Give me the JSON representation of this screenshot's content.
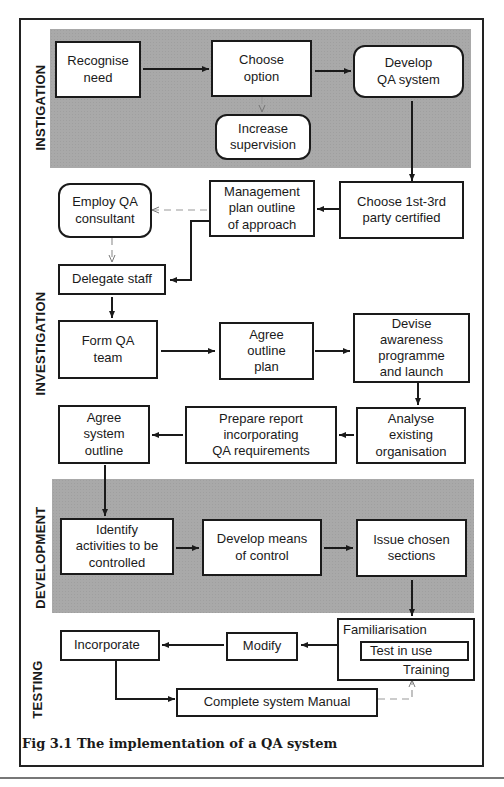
{
  "figure": {
    "caption": "Fig 3.1 The implementation of a QA system"
  },
  "phases": {
    "instigation": "INSTIGATION",
    "investigation": "INVESTIGATION",
    "development": "DEVELOPMENT",
    "testing": "TESTING"
  },
  "nodes": {
    "recognise_need": "Recognise\nneed",
    "choose_option": "Choose\noption",
    "develop_qa_system": "Develop\nQA system",
    "increase_supervision": "Increase\nsupervision",
    "employ_qa_consultant": "Employ QA\nconsultant",
    "management_plan": "Management\nplan outline\nof approach",
    "choose_party_certified": "Choose 1st-3rd\nparty certified",
    "delegate_staff": "Delegate staff",
    "form_qa_team": "Form QA\nteam",
    "agree_outline_plan": "Agree\noutline\nplan",
    "devise_awareness": "Devise\nawareness\nprogramme\nand launch",
    "agree_system_outline": "Agree\nsystem\noutline",
    "prepare_report": "Prepare report\nincorporating\nQA requirements",
    "analyse_existing": "Analyse\nexisting\norganisation",
    "identify_activities": "Identify\nactivities to be\ncontrolled",
    "develop_means_control": "Develop means\nof control",
    "issue_chosen_sections": "Issue chosen\nsections",
    "incorporate": "Incorporate",
    "modify": "Modify",
    "familiarisation": "Familiarisation",
    "test_in_use": "Test in use",
    "training": "Training",
    "complete_system_manual": "Complete system Manual"
  },
  "edges": [
    {
      "from": "recognise_need",
      "to": "choose_option",
      "style": "solid"
    },
    {
      "from": "choose_option",
      "to": "develop_qa_system",
      "style": "solid"
    },
    {
      "from": "choose_option",
      "to": "increase_supervision",
      "style": "dashed"
    },
    {
      "from": "develop_qa_system",
      "to": "choose_party_certified",
      "style": "solid"
    },
    {
      "from": "choose_party_certified",
      "to": "management_plan",
      "style": "solid"
    },
    {
      "from": "management_plan",
      "to": "employ_qa_consultant",
      "style": "dashed"
    },
    {
      "from": "management_plan",
      "to": "delegate_staff",
      "style": "solid"
    },
    {
      "from": "employ_qa_consultant",
      "to": "delegate_staff",
      "style": "dashed"
    },
    {
      "from": "delegate_staff",
      "to": "form_qa_team",
      "style": "solid"
    },
    {
      "from": "form_qa_team",
      "to": "agree_outline_plan",
      "style": "solid"
    },
    {
      "from": "agree_outline_plan",
      "to": "devise_awareness",
      "style": "solid"
    },
    {
      "from": "devise_awareness",
      "to": "analyse_existing",
      "style": "solid"
    },
    {
      "from": "analyse_existing",
      "to": "prepare_report",
      "style": "solid"
    },
    {
      "from": "prepare_report",
      "to": "agree_system_outline",
      "style": "solid"
    },
    {
      "from": "agree_system_outline",
      "to": "identify_activities",
      "style": "solid"
    },
    {
      "from": "identify_activities",
      "to": "develop_means_control",
      "style": "solid"
    },
    {
      "from": "develop_means_control",
      "to": "issue_chosen_sections",
      "style": "solid"
    },
    {
      "from": "issue_chosen_sections",
      "to": "familiarisation",
      "style": "solid"
    },
    {
      "from": "familiarisation",
      "to": "modify",
      "style": "solid"
    },
    {
      "from": "modify",
      "to": "incorporate",
      "style": "solid"
    },
    {
      "from": "incorporate",
      "to": "complete_system_manual",
      "style": "solid"
    },
    {
      "from": "complete_system_manual",
      "to": "familiarisation",
      "style": "dashed"
    }
  ],
  "colors": {
    "shade": "#a9a9a9",
    "line": "#1a1a1a",
    "dashed": "#999999"
  }
}
